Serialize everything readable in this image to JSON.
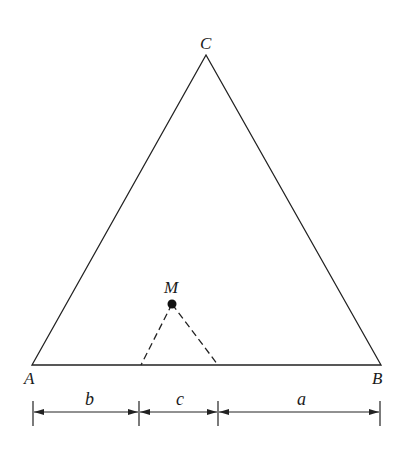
{
  "diagram": {
    "title": "",
    "colors": {
      "stroke": "#222222",
      "background": "#ffffff"
    },
    "vertices": {
      "A": {
        "label": "A",
        "x": 32,
        "y": 365
      },
      "B": {
        "label": "B",
        "x": 381,
        "y": 365
      },
      "C": {
        "label": "C",
        "x": 206,
        "y": 55
      }
    },
    "point_M": {
      "label": "M",
      "x": 172,
      "y": 304
    },
    "dashed_feet": [
      {
        "x": 141,
        "y": 365
      },
      {
        "x": 218,
        "y": 365
      }
    ],
    "dimensions": [
      {
        "label": "b",
        "from": 33,
        "to": 139
      },
      {
        "label": "c",
        "from": 139,
        "to": 218
      },
      {
        "label": "a",
        "from": 218,
        "to": 380
      }
    ]
  }
}
